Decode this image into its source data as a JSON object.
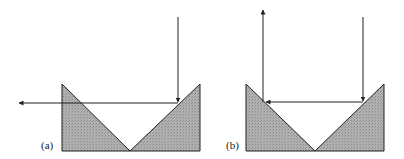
{
  "figure": {
    "panels": [
      {
        "id": "a",
        "label": "(a)",
        "description": "Two prisms in V arrangement; incoming vertical ray reflects off right prism face and exits horizontally to the left"
      },
      {
        "id": "b",
        "label": "(b)",
        "description": "Two prisms in V arrangement; incoming vertical ray reflects off right prism face horizontally, then off left prism face upward"
      }
    ],
    "colors": {
      "prism_fill": "#a9a9a9",
      "stroke": "#222222",
      "background": "#ffffff"
    }
  }
}
